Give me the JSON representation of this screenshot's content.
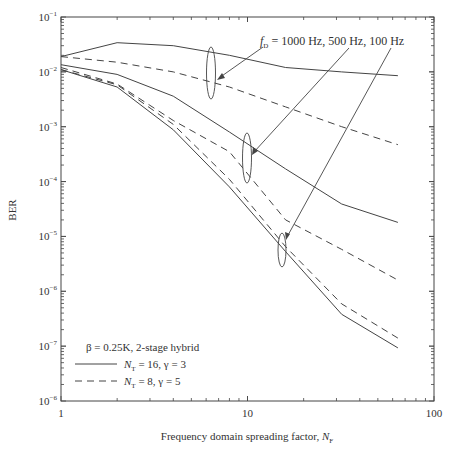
{
  "chart_data": {
    "type": "line",
    "title": "",
    "xlabel": "Frequency domain spreading factor, N_F",
    "xlabel_main": "Frequency domain spreading factor, ",
    "xlabel_sym": "N",
    "xlabel_sub": "F",
    "ylabel": "BER",
    "xscale": "log",
    "yscale": "log",
    "xlim": [
      1,
      100
    ],
    "ylim": [
      1e-08,
      0.1
    ],
    "x_ticks": [
      {
        "value": 1,
        "label": "1"
      },
      {
        "value": 10,
        "label": "10"
      },
      {
        "value": 100,
        "label": "100"
      }
    ],
    "y_ticks": [
      {
        "value": 0.1,
        "base": "10",
        "exp": "−1"
      },
      {
        "value": 0.01,
        "base": "10",
        "exp": "−2"
      },
      {
        "value": 0.001,
        "base": "10",
        "exp": "−3"
      },
      {
        "value": 0.0001,
        "base": "10",
        "exp": "−4"
      },
      {
        "value": 1e-05,
        "base": "10",
        "exp": "−5"
      },
      {
        "value": 1e-06,
        "base": "10",
        "exp": "−6"
      },
      {
        "value": 1e-07,
        "base": "10",
        "exp": "−7"
      },
      {
        "value": 1e-08,
        "base": "10",
        "exp": "−6"
      }
    ],
    "grid": false,
    "x": [
      1,
      2,
      4,
      8,
      16,
      32,
      64
    ],
    "series": [
      {
        "name": "fD=1000 Hz, NT=16, γ=3",
        "style": "solid",
        "values": [
          0.019,
          0.034,
          0.03,
          0.02,
          0.012,
          0.01,
          0.0085
        ]
      },
      {
        "name": "fD=1000 Hz, NT=8, γ=5",
        "style": "dashed",
        "values": [
          0.019,
          0.015,
          0.01,
          0.0053,
          0.0023,
          0.001,
          0.00047
        ]
      },
      {
        "name": "fD=500 Hz, NT=16, γ=3",
        "style": "solid",
        "values": [
          0.0135,
          0.009,
          0.0036,
          0.0008,
          0.00017,
          3.9e-05,
          1.8e-05
        ]
      },
      {
        "name": "fD=500 Hz, NT=8, γ=5",
        "style": "dashed",
        "values": [
          0.012,
          0.006,
          0.0013,
          0.00035,
          2e-05,
          5.8e-06,
          1.6e-06
        ]
      },
      {
        "name": "fD=100 Hz, NT=16, γ=3",
        "style": "solid",
        "values": [
          0.011,
          0.0053,
          0.00088,
          8e-05,
          5.3e-06,
          3.8e-07,
          9.3e-08
        ]
      },
      {
        "name": "fD=100 Hz, NT=8, γ=5",
        "style": "dashed",
        "values": [
          0.011,
          0.0058,
          0.0011,
          0.00011,
          6.5e-06,
          5.9e-07,
          1.4e-07
        ]
      }
    ],
    "annotation": {
      "prefix": "f",
      "sub": "D",
      "text": " = 1000 Hz, 500 Hz, 100 Hz"
    },
    "legend": {
      "position": "lower left",
      "title": "β = 0.25K, 2-stage hybrid",
      "entries": [
        {
          "style": "solid",
          "sym": "N",
          "sub": "T",
          "text": " = 16, γ = 3"
        },
        {
          "style": "dashed",
          "sym": "N",
          "sub": "T",
          "text": " = 8, γ = 5"
        }
      ]
    }
  }
}
